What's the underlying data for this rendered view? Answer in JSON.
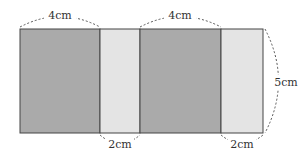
{
  "diagram": {
    "type": "net of a rectangular prism (unfolded side faces)",
    "faces": [
      {
        "id": "face-1",
        "shade": "dark",
        "width_cm": 4,
        "height_cm": 5
      },
      {
        "id": "face-2",
        "shade": "light",
        "width_cm": 2,
        "height_cm": 5
      },
      {
        "id": "face-3",
        "shade": "dark",
        "width_cm": 4,
        "height_cm": 5
      },
      {
        "id": "face-4",
        "shade": "light",
        "width_cm": 2,
        "height_cm": 5
      }
    ],
    "labels": {
      "top_left_width": "4cm",
      "top_middle_width": "4cm",
      "bottom_first_narrow": "2cm",
      "bottom_second_narrow": "2cm",
      "right_height": "5cm"
    },
    "colors": {
      "dark_fill": "#aaaaaa",
      "light_fill": "#e4e4e4",
      "outline": "#444444",
      "dash": "#555555",
      "text": "#333333"
    }
  }
}
